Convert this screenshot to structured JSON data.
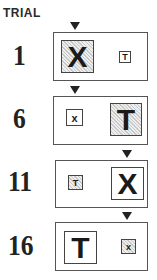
{
  "title": "TRIAL",
  "trials": [
    {
      "number": "1",
      "target_position": "left",
      "left": {
        "letter": "X",
        "size": "large",
        "hatched": true
      },
      "right": {
        "letter": "T",
        "size": "small",
        "hatched": false
      }
    },
    {
      "number": "6",
      "target_position": "left",
      "left": {
        "letter": "x",
        "size": "small",
        "hatched": false
      },
      "right": {
        "letter": "T",
        "size": "large",
        "hatched": true
      }
    },
    {
      "number": "11",
      "target_position": "right",
      "left": {
        "letter": "T",
        "size": "small",
        "hatched": true
      },
      "right": {
        "letter": "X",
        "size": "large",
        "hatched": false
      }
    },
    {
      "number": "16",
      "target_position": "right",
      "left": {
        "letter": "T",
        "size": "large",
        "hatched": false
      },
      "right": {
        "letter": "x",
        "size": "small",
        "hatched": true
      }
    }
  ],
  "colors": {
    "ink": "#222222",
    "border": "#555555",
    "hatch": "#c8c8c8"
  }
}
